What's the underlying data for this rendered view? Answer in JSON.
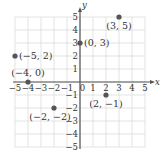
{
  "chart_data": {
    "type": "scatter",
    "title": "",
    "xlabel": "x",
    "ylabel": "y",
    "xlim": [
      -5,
      5
    ],
    "ylim": [
      -5,
      5
    ],
    "grid": true,
    "x_ticks": [
      -5,
      -4,
      -3,
      -2,
      -1,
      0,
      1,
      2,
      3,
      4,
      5
    ],
    "y_ticks": [
      -5,
      -4,
      -3,
      -2,
      -1,
      1,
      2,
      3,
      4,
      5
    ],
    "x_tick_labels": [
      "−5",
      "−4",
      "−3",
      "−2",
      "−1",
      "0",
      "1",
      "2",
      "3",
      "4",
      "5"
    ],
    "y_tick_labels": [
      "−5",
      "−4",
      "−3",
      "−2",
      "−1",
      "1",
      "2",
      "3",
      "4",
      "5"
    ],
    "points": [
      {
        "x": 3,
        "y": 5,
        "label": "(3, 5)"
      },
      {
        "x": 0,
        "y": 3,
        "label": "(0, 3)"
      },
      {
        "x": -5,
        "y": 2,
        "label": "(−5, 2)"
      },
      {
        "x": -4,
        "y": 0,
        "label": "(−4, 0)"
      },
      {
        "x": 2,
        "y": -1,
        "label": "(2, −1)"
      },
      {
        "x": -2,
        "y": -2,
        "label": "(−2, −2)"
      }
    ],
    "colors": {
      "point": "#555555",
      "axis": "#555555",
      "grid": "#dcdcdc"
    }
  }
}
